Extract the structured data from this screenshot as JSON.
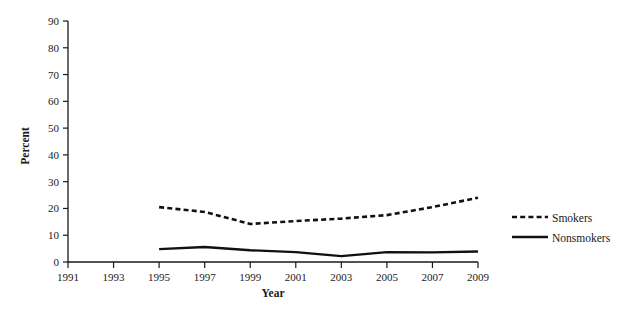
{
  "chart_data": {
    "type": "line",
    "title": "",
    "subtitle": "",
    "xlabel": "Year",
    "ylabel": "Percent",
    "x": [
      1995,
      1997,
      1999,
      2001,
      2003,
      2005,
      2007,
      2009
    ],
    "xlim": [
      1991,
      2009
    ],
    "ylim": [
      0,
      90
    ],
    "xticks": [
      "1991",
      "1993",
      "1995",
      "1997",
      "1999",
      "2001",
      "2003",
      "2005",
      "2007",
      "2009"
    ],
    "xtick_values": [
      1991,
      1993,
      1995,
      1997,
      1999,
      2001,
      2003,
      2005,
      2007,
      2009
    ],
    "yticks": [
      "0",
      "10",
      "20",
      "30",
      "40",
      "50",
      "60",
      "70",
      "80",
      "90"
    ],
    "ytick_values": [
      0,
      10,
      20,
      30,
      40,
      50,
      60,
      70,
      80,
      90
    ],
    "grid": false,
    "legend_position": "right",
    "series": [
      {
        "name": "Smokers",
        "style": "dashed",
        "color": "#111111",
        "x": [
          1995,
          1997,
          1999,
          2001,
          2003,
          2005,
          2007,
          2009
        ],
        "values": [
          20.5,
          18.7,
          14.2,
          15.3,
          16.2,
          17.5,
          20.5,
          24.0
        ]
      },
      {
        "name": "Nonsmokers",
        "style": "solid",
        "color": "#111111",
        "x": [
          1995,
          1997,
          1999,
          2001,
          2003,
          2005,
          2007,
          2009
        ],
        "values": [
          4.8,
          5.6,
          4.4,
          3.7,
          2.2,
          3.7,
          3.6,
          3.9
        ]
      }
    ],
    "annotations": []
  },
  "legend": {
    "items": [
      {
        "label": "Smokers",
        "style": "dashed"
      },
      {
        "label": "Nonsmokers",
        "style": "solid"
      }
    ]
  },
  "axes": {
    "x_title": "Year",
    "y_title": "Percent"
  }
}
